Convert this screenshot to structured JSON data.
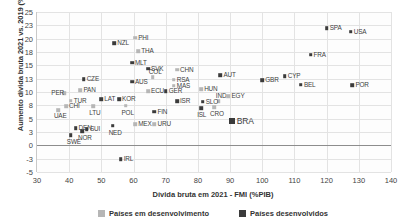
{
  "chart_data": {
    "type": "scatter",
    "title": "",
    "xlabel": "Dívida bruta em 2021 - FMI (%PIB)",
    "ylabel": "Aumento dívida bruta 2021 vs. 2019 (%PIB)",
    "xlim": [
      30,
      140
    ],
    "ylim": [
      -5,
      25
    ],
    "xticks": [
      30,
      40,
      50,
      60,
      70,
      80,
      90,
      100,
      110,
      120,
      130,
      140
    ],
    "yticks": [
      25,
      23,
      20,
      18,
      15,
      13,
      10,
      8,
      5,
      3,
      0,
      -3,
      -5
    ],
    "ytick_values": [
      25,
      22.5,
      20,
      17.5,
      15,
      12.5,
      10,
      7.5,
      5,
      2.5,
      0,
      -2.5,
      -5
    ],
    "grid": true,
    "legend_position": "bottom",
    "legend": [
      {
        "key": "emerg",
        "label": "Países em desenvolvimento",
        "color": "#b6b6b6"
      },
      {
        "key": "dev",
        "label": "Países desenvolvidos",
        "color": "#3b3b3b"
      }
    ],
    "series": [
      {
        "name": "Países em desenvolvimento",
        "key": "emerg",
        "color": "#b6b6b6",
        "points": [
          {
            "label": "PHI",
            "x": 60.5,
            "y": 20.2,
            "lx": 3,
            "ly": -4
          },
          {
            "label": "THA",
            "x": 61.5,
            "y": 17.6,
            "lx": 3,
            "ly": -4
          },
          {
            "label": "CHN",
            "x": 73.5,
            "y": 14.2,
            "lx": 3,
            "ly": -4
          },
          {
            "label": "RSA",
            "x": 72.5,
            "y": 12.3,
            "lx": 3,
            "ly": -4
          },
          {
            "label": "COL",
            "x": 66.0,
            "y": 12.8,
            "lx": -4,
            "ly": -9
          },
          {
            "label": "MAS",
            "x": 72.5,
            "y": 11.2,
            "lx": 3,
            "ly": -4
          },
          {
            "label": "ECU",
            "x": 64.5,
            "y": 10.1,
            "lx": 3,
            "ly": -4
          },
          {
            "label": "HUN",
            "x": 81.0,
            "y": 10.5,
            "lx": 3,
            "ly": -4
          },
          {
            "label": "PAN",
            "x": 43.5,
            "y": 10.3,
            "lx": 3,
            "ly": -4
          },
          {
            "label": "PER",
            "x": 38.5,
            "y": 9.8,
            "lx": -13,
            "ly": -4
          },
          {
            "label": "TUR",
            "x": 40.5,
            "y": 8.4,
            "lx": 3,
            "ly": -4
          },
          {
            "label": "IND",
            "x": 86.5,
            "y": 8.3,
            "lx": -3,
            "ly": -9
          },
          {
            "label": "CHI",
            "x": 39.0,
            "y": 7.3,
            "lx": 3,
            "ly": -4
          },
          {
            "label": "UAE",
            "x": 36.5,
            "y": 6.6,
            "lx": -4,
            "ly": 2
          },
          {
            "label": "LTU",
            "x": 47.5,
            "y": 7.3,
            "lx": -4,
            "ly": 3
          },
          {
            "label": "POL",
            "x": 57.5,
            "y": 7.4,
            "lx": -4,
            "ly": 3
          },
          {
            "label": "CRO",
            "x": 85.0,
            "y": 7.2,
            "lx": -4,
            "ly": 3
          },
          {
            "label": "EGY",
            "x": 89.5,
            "y": 9.2,
            "lx": 3,
            "ly": -4
          },
          {
            "label": "MEX",
            "x": 60.5,
            "y": 4.0,
            "lx": 3,
            "ly": -4
          },
          {
            "label": "URU",
            "x": 66.5,
            "y": 4.0,
            "lx": 3,
            "ly": -4
          }
        ]
      },
      {
        "name": "Países desenvolvidos",
        "key": "dev",
        "color": "#3b3b3b",
        "points": [
          {
            "label": "NZL",
            "x": 54.0,
            "y": 19.2,
            "lx": 3,
            "ly": -4
          },
          {
            "label": "MLT",
            "x": 59.5,
            "y": 15.5,
            "lx": 3,
            "ly": -4
          },
          {
            "label": "SVK",
            "x": 64.5,
            "y": 14.4,
            "lx": 3,
            "ly": -4
          },
          {
            "label": "SPA",
            "x": 120.0,
            "y": 22.0,
            "lx": 3,
            "ly": -4
          },
          {
            "label": "USA",
            "x": 127.5,
            "y": 21.3,
            "lx": 3,
            "ly": -4
          },
          {
            "label": "FRA",
            "x": 115.0,
            "y": 17.0,
            "lx": 3,
            "ly": -4
          },
          {
            "label": "CYP",
            "x": 107.0,
            "y": 13.0,
            "lx": 3,
            "ly": -4
          },
          {
            "label": "AUT",
            "x": 87.0,
            "y": 13.2,
            "lx": 3,
            "ly": -4
          },
          {
            "label": "GBR",
            "x": 100.0,
            "y": 12.2,
            "lx": 3,
            "ly": -4
          },
          {
            "label": "BEL",
            "x": 112.0,
            "y": 11.4,
            "lx": 3,
            "ly": -4
          },
          {
            "label": "POR",
            "x": 128.0,
            "y": 11.3,
            "lx": 3,
            "ly": -4
          },
          {
            "label": "AUS",
            "x": 59.5,
            "y": 11.9,
            "lx": 3,
            "ly": -4
          },
          {
            "label": "GER",
            "x": 70.0,
            "y": 10.1,
            "lx": 3,
            "ly": -4
          },
          {
            "label": "CZE",
            "x": 44.5,
            "y": 12.4,
            "lx": 3,
            "ly": -4
          },
          {
            "label": "LAT",
            "x": 50.0,
            "y": 8.6,
            "lx": 3,
            "ly": -4
          },
          {
            "label": "KOR",
            "x": 55.5,
            "y": 8.6,
            "lx": 3,
            "ly": -4
          },
          {
            "label": "ISR",
            "x": 73.5,
            "y": 8.3,
            "lx": 3,
            "ly": -4
          },
          {
            "label": "SLO",
            "x": 81.5,
            "y": 8.2,
            "lx": 3,
            "ly": -4
          },
          {
            "label": "ISL",
            "x": 81.0,
            "y": 7.0,
            "lx": -4,
            "ly": 3
          },
          {
            "label": "FIN",
            "x": 66.5,
            "y": 6.3,
            "lx": 3,
            "ly": -4
          },
          {
            "label": "NED",
            "x": 53.5,
            "y": 3.7,
            "lx": -4,
            "ly": 3
          },
          {
            "label": "DEN",
            "x": 42.0,
            "y": 3.2,
            "lx": 3,
            "ly": -4
          },
          {
            "label": "SUI",
            "x": 45.5,
            "y": 3.0,
            "lx": 3,
            "ly": -4
          },
          {
            "label": "NOR",
            "x": 44.0,
            "y": 2.7,
            "lx": -4,
            "ly": 3
          },
          {
            "label": "SWE",
            "x": 40.5,
            "y": 1.9,
            "lx": -4,
            "ly": 3
          },
          {
            "label": "IRL",
            "x": 56.0,
            "y": -2.6,
            "lx": 3,
            "ly": -4
          },
          {
            "label": "BRA",
            "x": 90.5,
            "y": 4.6,
            "lx": 5,
            "ly": -5,
            "big": true
          }
        ]
      }
    ]
  }
}
